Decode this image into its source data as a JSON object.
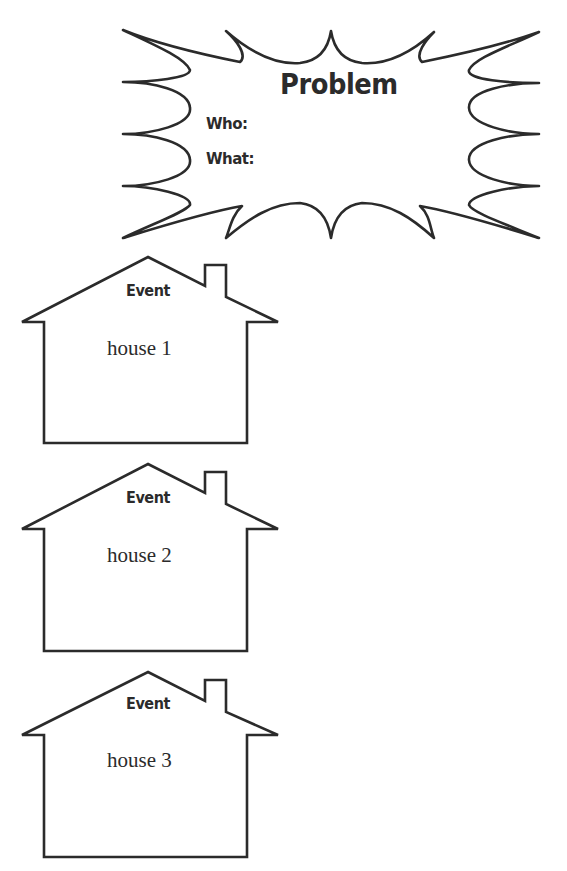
{
  "problem": {
    "title": "Problem",
    "who_label": "Who:",
    "what_label": "What:"
  },
  "houses": [
    {
      "heading": "Event",
      "text": "house 1"
    },
    {
      "heading": "Event",
      "text": "house 2"
    },
    {
      "heading": "Event",
      "text": "house 3"
    }
  ],
  "colors": {
    "stroke": "#2b2b2b",
    "background": "#ffffff"
  }
}
